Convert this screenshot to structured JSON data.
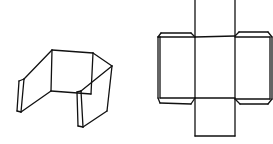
{
  "diagram": {
    "colors": {
      "background": "#ffffff",
      "line": "#111111"
    },
    "folded_box": {
      "label": "",
      "lines": [
        [
          24,
          79,
          52,
          50
        ],
        [
          52,
          50,
          93,
          53
        ],
        [
          93,
          53,
          112,
          66
        ],
        [
          52,
          50,
          51,
          91
        ],
        [
          93,
          53,
          91,
          94
        ],
        [
          51,
          91,
          91,
          94
        ],
        [
          24,
          79,
          21,
          112
        ],
        [
          19,
          81,
          17,
          111
        ],
        [
          19,
          81,
          24,
          79
        ],
        [
          17,
          111,
          21,
          112
        ],
        [
          21,
          112,
          51,
          91
        ],
        [
          112,
          66,
          81,
          91
        ],
        [
          112,
          66,
          107,
          111
        ],
        [
          81,
          91,
          83,
          127
        ],
        [
          77,
          92,
          78,
          126
        ],
        [
          77,
          92,
          81,
          91
        ],
        [
          78,
          126,
          83,
          127
        ],
        [
          83,
          127,
          107,
          111
        ]
      ]
    },
    "net": {
      "label": "",
      "lines": [
        [
          195,
          0,
          195,
          136
        ],
        [
          235,
          0,
          235,
          136
        ],
        [
          195,
          37,
          235,
          36
        ],
        [
          195,
          98,
          235,
          98
        ],
        [
          195,
          136,
          235,
          136
        ],
        [
          160,
          37,
          195,
          37
        ],
        [
          160,
          37,
          158,
          37
        ],
        [
          160,
          37,
          160,
          98
        ],
        [
          160,
          98,
          195,
          98
        ],
        [
          158,
          37,
          158,
          98
        ],
        [
          158,
          37,
          161,
          33
        ],
        [
          161,
          33,
          191,
          33
        ],
        [
          191,
          33,
          195,
          37
        ],
        [
          158,
          98,
          160,
          103
        ],
        [
          160,
          103,
          191,
          104
        ],
        [
          191,
          104,
          195,
          98
        ],
        [
          235,
          37,
          270,
          37
        ],
        [
          270,
          37,
          270,
          99
        ],
        [
          235,
          99,
          270,
          99
        ],
        [
          235,
          36,
          239,
          32
        ],
        [
          239,
          32,
          268,
          32
        ],
        [
          268,
          32,
          272,
          37
        ],
        [
          272,
          37,
          272,
          99
        ],
        [
          272,
          99,
          268,
          104
        ],
        [
          268,
          104,
          240,
          104
        ],
        [
          240,
          104,
          235,
          99
        ]
      ]
    }
  }
}
